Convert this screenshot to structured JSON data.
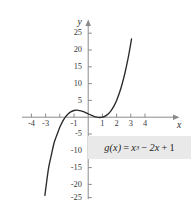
{
  "figure": {
    "background_color": "#ffffff",
    "curve_color": "#2b2b2b",
    "axis_color": "#8a8a8d",
    "label_box_color": "#e9e9ea",
    "x_axis_name": "x",
    "y_axis_name": "y"
  },
  "equation": {
    "function_name": "g",
    "variable": "x",
    "lhs": "g(x)",
    "equals": "=",
    "term1_base": "x",
    "term1_exponent": "3",
    "minus": "−",
    "term2": "2x",
    "plus": "+",
    "term3": "1",
    "full_text": "g(x) = x³ − 2x + 1"
  },
  "chart_data": {
    "type": "line",
    "title": "",
    "subtitle": "",
    "xlabel": "x",
    "ylabel": "y",
    "xlim": [
      -4.6,
      4.6
    ],
    "ylim": [
      -27,
      27
    ],
    "grid": false,
    "legend": "none",
    "annotations": [
      "g(x) = x³ − 2x + 1"
    ],
    "x_ticks": [
      -4,
      -3,
      -2,
      -1,
      1,
      2,
      3,
      4
    ],
    "x_tick_labels": [
      "-4",
      "-3",
      "",
      "-1",
      "1",
      "2",
      "3",
      "4"
    ],
    "y_ticks": [
      25,
      20,
      15,
      10,
      5,
      -5,
      -10,
      -15,
      -20,
      -25
    ],
    "y_tick_labels": [
      "25",
      "20",
      "15",
      "10",
      "5",
      "-5",
      "-10",
      "-15",
      "-20",
      "-25"
    ],
    "series": [
      {
        "name": "g(x) = x^3 - 2x + 1",
        "formula": "x^3 - 2x + 1",
        "x_range": [
          -3.05,
          3.05
        ],
        "local_maximum": [
          -0.816,
          2.089
        ],
        "local_minimum": [
          0.816,
          -0.089
        ],
        "y_intercept": 1,
        "x_intercepts": [
          -1.618,
          0.618,
          1.0
        ],
        "points": [
          [
            -3.05,
            -23.27
          ],
          [
            -2.8,
            -15.35
          ],
          [
            -2.6,
            -11.38
          ],
          [
            -2.4,
            -7.62
          ],
          [
            -2.2,
            -5.25
          ],
          [
            -2.0,
            -3.0
          ],
          [
            -1.8,
            -1.23
          ],
          [
            -1.6,
            0.1
          ],
          [
            -1.4,
            1.06
          ],
          [
            -1.2,
            1.67
          ],
          [
            -1.0,
            2.0
          ],
          [
            -0.8,
            2.09
          ],
          [
            -0.6,
            1.98
          ],
          [
            -0.4,
            1.74
          ],
          [
            -0.2,
            1.39
          ],
          [
            0.0,
            1.0
          ],
          [
            0.2,
            0.61
          ],
          [
            0.4,
            0.26
          ],
          [
            0.6,
            0.02
          ],
          [
            0.8,
            -0.09
          ],
          [
            1.0,
            0.0
          ],
          [
            1.2,
            0.33
          ],
          [
            1.4,
            0.94
          ],
          [
            1.6,
            1.9
          ],
          [
            1.8,
            3.23
          ],
          [
            2.0,
            5.0
          ],
          [
            2.2,
            7.25
          ],
          [
            2.4,
            10.02
          ],
          [
            2.6,
            13.38
          ],
          [
            2.8,
            17.35
          ],
          [
            3.0,
            22.0
          ],
          [
            3.05,
            23.27
          ]
        ]
      }
    ]
  }
}
